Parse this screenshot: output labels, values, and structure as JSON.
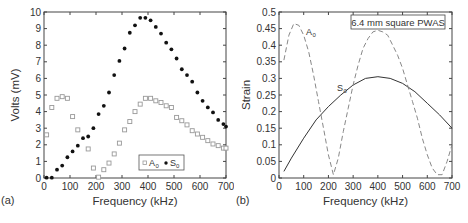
{
  "chart_data": [
    {
      "type": "scatter",
      "panel_label": "(a)",
      "xlabel": "Frequency (kHz)",
      "ylabel": "Volts (mV)",
      "xlim": [
        0,
        700
      ],
      "ylim": [
        0,
        10
      ],
      "xticks": [
        0,
        100,
        200,
        300,
        400,
        500,
        600,
        700
      ],
      "yticks": [
        0,
        1,
        2,
        3,
        4,
        5,
        6,
        7,
        8,
        9,
        10
      ],
      "legend": [
        "A0",
        "S0"
      ],
      "legend_position": "lower-right",
      "series": [
        {
          "name": "A0",
          "marker": "open-square",
          "color": "#888888",
          "x": [
            10,
            30,
            50,
            70,
            90,
            110,
            130,
            170,
            190,
            210,
            230,
            250,
            270,
            290,
            310,
            330,
            350,
            370,
            390,
            410,
            430,
            450,
            470,
            490,
            510,
            530,
            550,
            570,
            590,
            610,
            630,
            650,
            670,
            690,
            700
          ],
          "y": [
            2.6,
            4.25,
            4.8,
            4.9,
            4.8,
            3.7,
            2.9,
            1.75,
            0.6,
            0.05,
            0.5,
            0.9,
            1.45,
            2.1,
            2.9,
            3.4,
            4.0,
            4.45,
            4.8,
            4.8,
            4.65,
            4.55,
            4.35,
            4.25,
            3.65,
            3.45,
            3.2,
            2.85,
            2.65,
            2.45,
            2.25,
            2.05,
            1.95,
            1.8,
            1.8
          ]
        },
        {
          "name": "S0",
          "marker": "filled-circle",
          "color": "#111111",
          "x": [
            10,
            30,
            50,
            70,
            90,
            110,
            130,
            150,
            170,
            190,
            210,
            230,
            250,
            270,
            290,
            310,
            330,
            350,
            370,
            390,
            410,
            430,
            450,
            470,
            490,
            510,
            530,
            550,
            570,
            590,
            610,
            630,
            650,
            670,
            690,
            700
          ],
          "y": [
            0.02,
            0.02,
            0.5,
            0.75,
            1.25,
            1.6,
            1.95,
            2.4,
            2.5,
            3.0,
            3.85,
            4.35,
            5.15,
            6.2,
            7.05,
            7.8,
            8.75,
            9.2,
            9.65,
            9.65,
            9.5,
            9.1,
            8.7,
            8.15,
            7.75,
            7.2,
            6.55,
            6.2,
            5.8,
            5.15,
            4.65,
            4.25,
            3.95,
            3.5,
            3.25,
            3.1
          ]
        }
      ]
    },
    {
      "type": "line",
      "panel_label": "(b)",
      "xlabel": "Frequency (kHz)",
      "ylabel": "Strain",
      "xlim": [
        0,
        700
      ],
      "ylim": [
        0,
        0.5
      ],
      "xticks": [
        0,
        100,
        200,
        300,
        400,
        500,
        600,
        700
      ],
      "yticks": [
        0,
        0.05,
        0.1,
        0.15,
        0.2,
        0.25,
        0.3,
        0.35,
        0.4,
        0.45,
        0.5
      ],
      "annotation": "6.4 mm square PWAS",
      "series": [
        {
          "name": "A0",
          "style": "dashed",
          "color": "#888888",
          "x": [
            20,
            40,
            60,
            80,
            100,
            120,
            140,
            160,
            180,
            200,
            220,
            240,
            260,
            280,
            300,
            320,
            340,
            360,
            380,
            400,
            420,
            440,
            460,
            480,
            500,
            520,
            540,
            560,
            580,
            600,
            620,
            640,
            660,
            680,
            700
          ],
          "y": [
            0.355,
            0.43,
            0.465,
            0.46,
            0.43,
            0.38,
            0.31,
            0.23,
            0.15,
            0.07,
            0.01,
            0.06,
            0.14,
            0.21,
            0.28,
            0.34,
            0.39,
            0.42,
            0.44,
            0.445,
            0.44,
            0.43,
            0.4,
            0.37,
            0.33,
            0.28,
            0.23,
            0.18,
            0.12,
            0.07,
            0.03,
            0.01,
            0.01,
            0.05,
            0.1
          ]
        },
        {
          "name": "S0",
          "style": "solid",
          "color": "#333333",
          "x": [
            20,
            50,
            100,
            150,
            200,
            250,
            300,
            350,
            400,
            450,
            500,
            550,
            600,
            650,
            700
          ],
          "y": [
            0.02,
            0.06,
            0.12,
            0.175,
            0.215,
            0.25,
            0.28,
            0.3,
            0.305,
            0.3,
            0.285,
            0.26,
            0.225,
            0.19,
            0.15
          ]
        }
      ],
      "curve_labels": [
        {
          "text": "A0",
          "x": 75,
          "y": 0.44
        },
        {
          "text": "S0",
          "x": 190,
          "y": 0.27
        }
      ]
    }
  ],
  "labels": {
    "a": {
      "panel": "(a)",
      "xlabel": "Frequency (kHz)",
      "ylabel": "Volts (mV)",
      "legend_a0": "A",
      "legend_s0": "S",
      "sub": "0"
    },
    "b": {
      "panel": "(b)",
      "xlabel": "Frequency (kHz)",
      "ylabel": "Strain",
      "annotation": "6.4 mm square PWAS",
      "a0": "A",
      "s0": "S",
      "sub": "0"
    }
  }
}
